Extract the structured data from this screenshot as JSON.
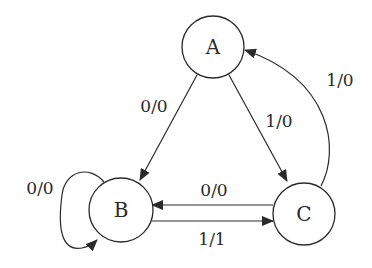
{
  "diagram": {
    "type": "finite-state-machine",
    "states": [
      {
        "id": "A",
        "label": "A"
      },
      {
        "id": "B",
        "label": "B"
      },
      {
        "id": "C",
        "label": "C"
      }
    ],
    "transitions": [
      {
        "from": "A",
        "to": "B",
        "label": "0/0"
      },
      {
        "from": "A",
        "to": "C",
        "label": "1/0"
      },
      {
        "from": "C",
        "to": "A",
        "label": "1/0"
      },
      {
        "from": "B",
        "to": "B",
        "label": "0/0"
      },
      {
        "from": "C",
        "to": "B",
        "label": "0/0"
      },
      {
        "from": "B",
        "to": "C",
        "label": "1/1"
      }
    ]
  },
  "colors": {
    "stroke": "#2a2a2a",
    "background": "#ffffff"
  }
}
